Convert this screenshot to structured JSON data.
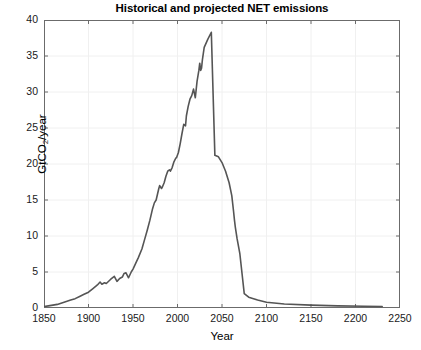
{
  "chart_data": {
    "type": "line",
    "title": "Historical and projected NET emissions",
    "xlabel": "Year",
    "ylabel": "GtCO2/year",
    "ylabel_prefix": "GtCO",
    "ylabel_sub": "2",
    "ylabel_suffix": "/year",
    "xlim": [
      1850,
      2250
    ],
    "ylim": [
      0,
      40
    ],
    "xticks": [
      1850,
      1900,
      1950,
      2000,
      2050,
      2100,
      2150,
      2200,
      2250
    ],
    "yticks": [
      0,
      5,
      10,
      15,
      20,
      25,
      30,
      35,
      40
    ],
    "xtick_labels": [
      "1850",
      "1900",
      "1950",
      "2000",
      "2050",
      "2100",
      "2150",
      "2200",
      "2250"
    ],
    "ytick_labels": [
      "0",
      "5",
      "10",
      "15",
      "20",
      "25",
      "30",
      "35",
      "40"
    ],
    "grid": true,
    "grid_color": "#f0f0f0",
    "line_color": "#555555",
    "line_width": 1.6,
    "axes_color": "#6b6b6b",
    "background": "#ffffff",
    "legend": null,
    "series": [
      {
        "name": "NET emissions",
        "x": [
          1850,
          1855,
          1860,
          1865,
          1870,
          1875,
          1880,
          1885,
          1890,
          1895,
          1900,
          1905,
          1910,
          1913,
          1915,
          1918,
          1920,
          1925,
          1929,
          1932,
          1935,
          1938,
          1940,
          1942,
          1945,
          1948,
          1950,
          1953,
          1956,
          1960,
          1963,
          1966,
          1969,
          1972,
          1974,
          1976,
          1979,
          1980,
          1982,
          1983,
          1985,
          1987,
          1989,
          1991,
          1992,
          1994,
          1996,
          1998,
          1999,
          2001,
          2003,
          2005,
          2007,
          2009,
          2010,
          2012,
          2014,
          2016,
          2018,
          2020,
          2022,
          2024,
          2025,
          2026,
          2027,
          2028,
          2030,
          2034,
          2038,
          2042,
          2046,
          2050,
          2054,
          2058,
          2061,
          2063,
          2064,
          2065,
          2067,
          2070,
          2075,
          2080,
          2090,
          2100,
          2120,
          2150,
          2180,
          2210,
          2230
        ],
        "y": [
          0.2,
          0.3,
          0.4,
          0.5,
          0.7,
          0.9,
          1.1,
          1.3,
          1.6,
          1.9,
          2.2,
          2.7,
          3.2,
          3.6,
          3.3,
          3.5,
          3.4,
          4.0,
          4.4,
          3.7,
          4.1,
          4.3,
          4.8,
          4.9,
          4.2,
          5.0,
          5.4,
          6.2,
          7.0,
          8.2,
          9.5,
          10.8,
          12.2,
          13.8,
          14.6,
          15.0,
          16.6,
          17.0,
          16.6,
          16.8,
          17.4,
          18.3,
          19.0,
          19.2,
          19.0,
          19.5,
          20.3,
          20.8,
          20.9,
          21.6,
          22.8,
          24.2,
          25.5,
          25.3,
          26.7,
          28.0,
          29.0,
          29.5,
          30.4,
          29.2,
          31.5,
          33.0,
          34.0,
          33.0,
          33.3,
          34.5,
          36.2,
          37.3,
          38.3,
          21.2,
          21.0,
          20.2,
          19.0,
          17.4,
          15.6,
          13.4,
          12.2,
          11.2,
          9.6,
          7.6,
          2.0,
          1.5,
          1.1,
          0.8,
          0.55,
          0.4,
          0.3,
          0.25,
          0.2
        ]
      }
    ],
    "annotations": []
  }
}
